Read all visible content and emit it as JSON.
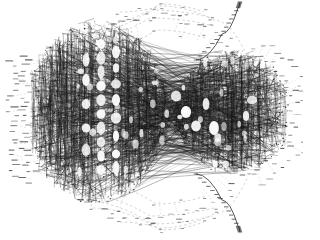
{
  "figure": {
    "title": "Dense force-directed graph layout",
    "kind": "node-link-diagram",
    "background_color": "#ffffff",
    "ink_color": "#111111",
    "faint_color": "#9a9a9a",
    "width": 303,
    "height": 233
  },
  "chart_data": {
    "type": "scatter",
    "title": "Dense force-directed graph layout",
    "xlabel": "",
    "ylabel": "",
    "xlim": [
      0,
      303
    ],
    "ylim": [
      0,
      233
    ],
    "grid": false,
    "legend_position": "none",
    "palette": {
      "core_edge": "#141414",
      "mid_edge": "#444444",
      "hull_edge": "#9c9c9c",
      "leaf_node": "#2a2a2a",
      "void": "#ffffff"
    },
    "core": {
      "comment": "Dense body spans roughly x 30..290, y 18..205; narrows at a waist near x=168 then bulges to a right lobe centered near x=232.",
      "left_bulge_center": [
        98,
        112
      ],
      "left_bulge_rx": 72,
      "left_bulge_ry": 92,
      "waist_x": 168,
      "waist_half_height": 56,
      "right_lobe_center": [
        232,
        112
      ],
      "right_lobe_rx": 60,
      "right_lobe_ry": 62
    },
    "bands": {
      "comment": "Vertical bands of edge density across the core; value = relative ink density 0..1",
      "x": [
        34,
        42,
        50,
        58,
        66,
        74,
        82,
        90,
        98,
        106,
        114,
        122,
        130,
        138,
        146,
        154,
        162,
        170,
        178,
        186,
        194,
        202,
        210,
        218,
        226,
        234,
        242,
        250,
        258,
        266,
        274,
        282
      ],
      "values": [
        0.42,
        0.66,
        0.82,
        0.9,
        0.86,
        0.78,
        0.7,
        0.55,
        0.38,
        0.3,
        0.46,
        0.62,
        0.74,
        0.8,
        0.72,
        0.66,
        0.6,
        0.55,
        0.62,
        0.7,
        0.66,
        0.58,
        0.64,
        0.72,
        0.78,
        0.8,
        0.74,
        0.66,
        0.54,
        0.4,
        0.26,
        0.12
      ]
    },
    "voids": {
      "comment": "Bright elliptical gaps forming a ladder through the left-centre of the core",
      "points": [
        [
          101,
          44
        ],
        [
          101,
          58
        ],
        [
          101,
          72
        ],
        [
          101,
          86
        ],
        [
          101,
          100
        ],
        [
          101,
          114
        ],
        [
          101,
          128
        ],
        [
          101,
          142
        ],
        [
          101,
          156
        ],
        [
          101,
          170
        ],
        [
          116,
          52
        ],
        [
          116,
          68
        ],
        [
          116,
          84
        ],
        [
          116,
          100
        ],
        [
          116,
          118
        ],
        [
          116,
          136
        ],
        [
          116,
          154
        ],
        [
          116,
          168
        ],
        [
          86,
          60
        ],
        [
          86,
          80
        ],
        [
          86,
          104
        ],
        [
          86,
          128
        ],
        [
          86,
          150
        ],
        [
          176,
          96
        ],
        [
          186,
          112
        ],
        [
          196,
          126
        ],
        [
          206,
          104
        ],
        [
          214,
          128
        ],
        [
          246,
          116
        ],
        [
          252,
          100
        ]
      ]
    },
    "hull_arcs": {
      "comment": "Faint dashed arcs sweeping above and below the core (convex-hull-like bundles)",
      "top": [
        [
          [
            36,
            120
          ],
          [
            70,
            42
          ],
          [
            150,
            18
          ],
          [
            214,
            26
          ]
        ],
        [
          [
            40,
            108
          ],
          [
            78,
            34
          ],
          [
            152,
            10
          ],
          [
            212,
            18
          ]
        ],
        [
          [
            44,
            126
          ],
          [
            84,
            54
          ],
          [
            156,
            30
          ],
          [
            206,
            38
          ]
        ],
        [
          [
            52,
            96
          ],
          [
            92,
            26
          ],
          [
            160,
            4
          ],
          [
            204,
            12
          ]
        ],
        [
          [
            120,
            12
          ],
          [
            160,
            6
          ],
          [
            214,
            20
          ],
          [
            248,
            58
          ]
        ]
      ],
      "bottom": [
        [
          [
            36,
            114
          ],
          [
            70,
            192
          ],
          [
            150,
            216
          ],
          [
            214,
            208
          ]
        ],
        [
          [
            40,
            126
          ],
          [
            78,
            200
          ],
          [
            152,
            224
          ],
          [
            212,
            216
          ]
        ],
        [
          [
            44,
            108
          ],
          [
            84,
            180
          ],
          [
            156,
            204
          ],
          [
            206,
            196
          ]
        ],
        [
          [
            52,
            138
          ],
          [
            92,
            208
          ],
          [
            160,
            230
          ],
          [
            204,
            222
          ]
        ],
        [
          [
            120,
            222
          ],
          [
            160,
            228
          ],
          [
            214,
            214
          ],
          [
            248,
            176
          ]
        ]
      ]
    },
    "tendrils": {
      "comment": "Two thin spikes leaving the core toward the top-right and bottom-right corners",
      "top_right": [
        [
          196,
          60
        ],
        [
          222,
          34
        ],
        [
          238,
          8
        ],
        [
          240,
          2
        ]
      ],
      "bottom_right": [
        [
          196,
          174
        ],
        [
          222,
          200
        ],
        [
          238,
          226
        ],
        [
          240,
          232
        ]
      ]
    },
    "leaf_clusters": [
      {
        "name": "left-outer-column",
        "x": 12,
        "y_start": 62,
        "y_end": 176,
        "count": 22,
        "jitter": 5
      },
      {
        "name": "left-inner-column",
        "x": 26,
        "y_start": 56,
        "y_end": 182,
        "count": 26,
        "jitter": 5
      },
      {
        "name": "left-mid-column",
        "x": 40,
        "y_start": 66,
        "y_end": 170,
        "count": 18,
        "jitter": 4
      },
      {
        "name": "right-fan-inner",
        "cx": 232,
        "cy": 112,
        "r": 62,
        "a_start": -72,
        "a_end": 72,
        "count": 26
      },
      {
        "name": "right-fan-outer",
        "cx": 232,
        "cy": 112,
        "r": 76,
        "a_start": -66,
        "a_end": 66,
        "count": 22
      },
      {
        "name": "top-fan",
        "cx": 150,
        "cy": 120,
        "r": 104,
        "a_start": 200,
        "a_end": 340,
        "count": 30
      },
      {
        "name": "bottom-fan",
        "cx": 150,
        "cy": 116,
        "r": 104,
        "a_start": 20,
        "a_end": 160,
        "count": 30
      }
    ],
    "counts": {
      "approx_nodes": 1480,
      "approx_edges": 9200,
      "visible_leaf_ticks": 174
    }
  }
}
